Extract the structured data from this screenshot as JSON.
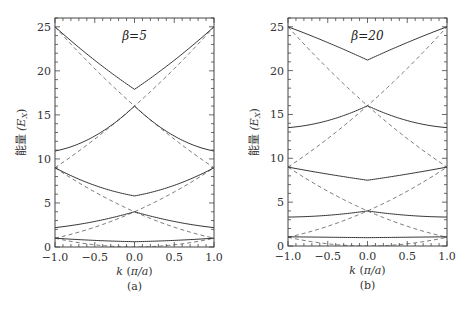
{
  "chart_data": [
    {
      "type": "line",
      "panel_label": "(a)",
      "title": "β=5",
      "xlabel": "k (π/a)",
      "ylabel": "能量 (E_X)",
      "xlim": [
        -1.0,
        1.0
      ],
      "ylim": [
        0,
        26
      ],
      "xticks": [
        "-1.0",
        "-0.5",
        "0.0",
        "0.5",
        "1.0"
      ],
      "yticks": [
        "0",
        "5",
        "10",
        "15",
        "20",
        "25"
      ],
      "grid": false,
      "legend": null,
      "series": [
        {
          "name": "band 1",
          "style": "solid",
          "x": [
            -1.0,
            -0.5,
            0.0,
            0.5,
            1.0
          ],
          "values": [
            1.0,
            0.75,
            0.6,
            0.75,
            1.0
          ]
        },
        {
          "name": "band 2",
          "style": "solid",
          "x": [
            -1.0,
            -0.5,
            0.0,
            0.5,
            1.0
          ],
          "values": [
            2.2,
            2.9,
            4.0,
            2.9,
            2.2
          ]
        },
        {
          "name": "band 3",
          "style": "solid",
          "x": [
            -1.0,
            -0.5,
            0.0,
            0.5,
            1.0
          ],
          "values": [
            9.0,
            7.0,
            5.8,
            7.0,
            9.0
          ]
        },
        {
          "name": "band 4",
          "style": "solid",
          "x": [
            -1.0,
            -0.5,
            0.0,
            0.5,
            1.0
          ],
          "values": [
            10.9,
            12.6,
            16.0,
            12.6,
            10.9
          ]
        },
        {
          "name": "band 5",
          "style": "solid",
          "x": [
            -1.0,
            -0.5,
            0.0,
            0.5,
            1.0
          ],
          "values": [
            25.0,
            21.2,
            17.9,
            21.2,
            25.0
          ]
        },
        {
          "name": "free electron k^2",
          "style": "dashed",
          "formula": "k^2"
        },
        {
          "name": "free electron (k-2)^2",
          "style": "dashed",
          "formula": "(k-2)^2"
        },
        {
          "name": "free electron (k+2)^2",
          "style": "dashed",
          "formula": "(k+2)^2"
        },
        {
          "name": "free electron (k-4)^2",
          "style": "dashed",
          "formula": "(k-4)^2"
        },
        {
          "name": "free electron (k+4)^2",
          "style": "dashed",
          "formula": "(k+4)^2"
        }
      ]
    },
    {
      "type": "line",
      "panel_label": "(b)",
      "title": "β=20",
      "xlabel": "k (π/a)",
      "ylabel": "能量 (E_X)",
      "xlim": [
        -1.0,
        1.0
      ],
      "ylim": [
        0,
        26
      ],
      "xticks": [
        "-1.0",
        "-0.5",
        "0.0",
        "0.5",
        "1.0"
      ],
      "yticks": [
        "0",
        "5",
        "10",
        "15",
        "20",
        "25"
      ],
      "grid": false,
      "legend": null,
      "series": [
        {
          "name": "band 1",
          "style": "solid",
          "x": [
            -1.0,
            -0.5,
            0.0,
            0.5,
            1.0
          ],
          "values": [
            1.05,
            1.0,
            0.95,
            1.0,
            1.05
          ]
        },
        {
          "name": "band 2",
          "style": "solid",
          "x": [
            -1.0,
            -0.5,
            0.0,
            0.5,
            1.0
          ],
          "values": [
            3.3,
            3.5,
            4.0,
            3.5,
            3.3
          ]
        },
        {
          "name": "band 3",
          "style": "solid",
          "x": [
            -1.0,
            -0.5,
            0.0,
            0.5,
            1.0
          ],
          "values": [
            9.0,
            8.2,
            7.5,
            8.2,
            9.0
          ]
        },
        {
          "name": "band 4",
          "style": "solid",
          "x": [
            -1.0,
            -0.5,
            0.0,
            0.5,
            1.0
          ],
          "values": [
            13.5,
            14.3,
            16.0,
            14.3,
            13.5
          ]
        },
        {
          "name": "band 5",
          "style": "solid",
          "x": [
            -1.0,
            -0.5,
            0.0,
            0.5,
            1.0
          ],
          "values": [
            25.0,
            23.2,
            21.2,
            23.2,
            25.0
          ]
        },
        {
          "name": "free electron k^2",
          "style": "dashed",
          "formula": "k^2"
        },
        {
          "name": "free electron (k-2)^2",
          "style": "dashed",
          "formula": "(k-2)^2"
        },
        {
          "name": "free electron (k+2)^2",
          "style": "dashed",
          "formula": "(k+2)^2"
        },
        {
          "name": "free electron (k-4)^2",
          "style": "dashed",
          "formula": "(k-4)^2"
        },
        {
          "name": "free electron (k+4)^2",
          "style": "dashed",
          "formula": "(k+4)^2"
        }
      ]
    }
  ],
  "panels": [
    {
      "title": "β=5",
      "label": "(a)",
      "xlabel": "k (π/a)",
      "ylabel_cn": "能量",
      "ylabel_sym": "(E",
      "ylabel_sub": "X",
      "ylabel_close": ")"
    },
    {
      "title": "β=20",
      "label": "(b)",
      "xlabel": "k (π/a)",
      "ylabel_cn": "能量",
      "ylabel_sym": "(E",
      "ylabel_sub": "X",
      "ylabel_close": ")"
    }
  ],
  "colors": {
    "solid_line": "#333333",
    "dashed_line": "#555555",
    "frame": "#444444"
  }
}
